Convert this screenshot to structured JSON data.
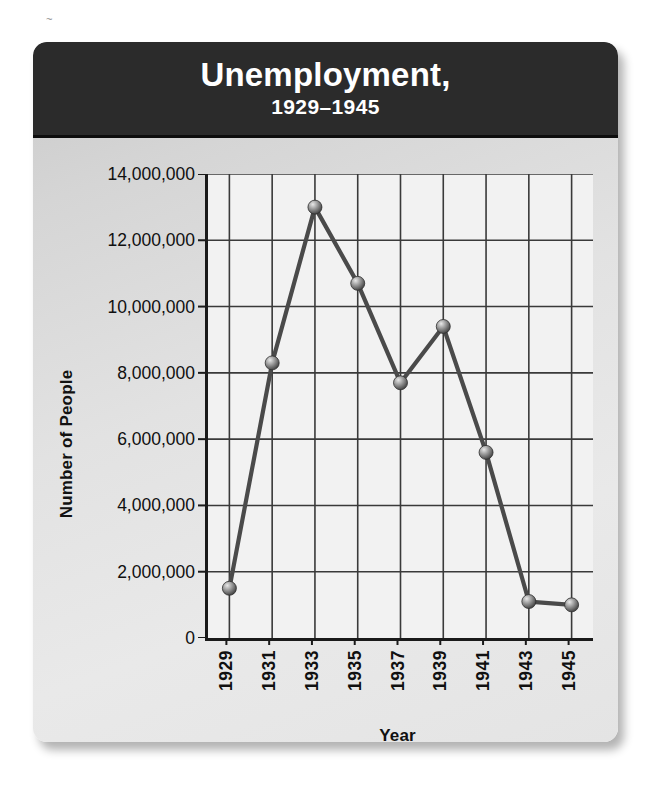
{
  "header": {
    "title": "Unemployment,",
    "subtitle": "1929–1945"
  },
  "colors": {
    "header_background": "#2b2b2b",
    "header_text": "#ffffff",
    "card_background": "#e2e2e2",
    "plot_background": "#f2f2f2",
    "axis": "#1a1a1a",
    "grid": "#3a3a3a",
    "line": "#4a4a4a",
    "marker": "#8f8f8f"
  },
  "chart_data": {
    "type": "line",
    "title": "Unemployment,",
    "subtitle": "1929–1945",
    "xlabel": "Year",
    "ylabel": "Number of People",
    "x": [
      1929,
      1931,
      1933,
      1935,
      1937,
      1939,
      1941,
      1943,
      1945
    ],
    "categories": [
      "1929",
      "1931",
      "1933",
      "1935",
      "1937",
      "1939",
      "1941",
      "1943",
      "1945"
    ],
    "values": [
      1500000,
      8300000,
      13000000,
      10700000,
      7700000,
      9400000,
      5600000,
      1100000,
      1000000
    ],
    "series": [
      {
        "name": "Number of People",
        "values": [
          1500000,
          8300000,
          13000000,
          10700000,
          7700000,
          9400000,
          5600000,
          1100000,
          1000000
        ]
      }
    ],
    "xlim": [
      1928,
      1946
    ],
    "ylim": [
      0,
      14000000
    ],
    "ytick_values": [
      0,
      2000000,
      4000000,
      6000000,
      8000000,
      10000000,
      12000000,
      14000000
    ],
    "ytick_labels": [
      "0",
      "2,000,000",
      "4,000,000",
      "6,000,000",
      "8,000,000",
      "10,000,000",
      "12,000,000",
      "14,000,000"
    ],
    "xtick_labels": [
      "1929",
      "1931",
      "1933",
      "1935",
      "1937",
      "1939",
      "1941",
      "1943",
      "1945"
    ],
    "grid": true,
    "grid_axes": "both",
    "legend": null,
    "markers": "sphere"
  }
}
